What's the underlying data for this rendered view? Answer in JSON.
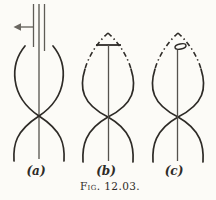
{
  "figure": {
    "caption": "Fig. 12.03.",
    "background_color": "#fcfbf7",
    "ink_color": "#2e2b27",
    "feed_line_color": "#5f5c56",
    "diagrams": [
      {
        "label": "(a)",
        "description": "crossed standing-wave curves with twin-lead feed lines entering from top and a left-pointing arrow marker",
        "icon": "left-arrow-icon"
      },
      {
        "label": "(b)",
        "description": "closed lens-shaped crossed curves, dash-dot near apex, with T-shaped top-loaded vertical wire",
        "icon": "t-bar-icon"
      },
      {
        "label": "(c)",
        "description": "closed lens-shaped crossed curves, dash-dot near apex, with small flat loop atop vertical wire",
        "icon": "small-loop-icon"
      }
    ]
  }
}
